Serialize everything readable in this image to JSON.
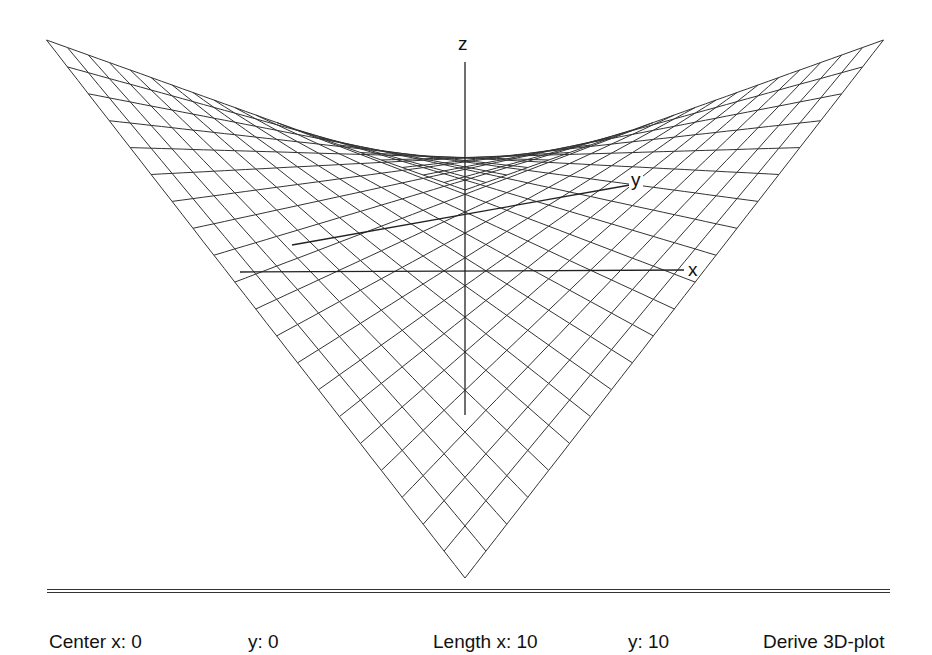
{
  "window": {
    "title": "3D-plot"
  },
  "plot": {
    "axis_labels": {
      "x": "x",
      "y": "y",
      "z": "z"
    },
    "grid_lines": 21,
    "line_color": "#333333",
    "axis_color": "#222222"
  },
  "status_bar": {
    "center_x_label": "Center x: 0",
    "center_y_label": "y: 0",
    "length_x_label": "Length x: 10",
    "length_y_label": "y: 10",
    "action_label": "Derive 3D-plot"
  },
  "chart_data": {
    "type": "surface-wireframe",
    "title": "",
    "function": "saddle (hyperbolic paraboloid)",
    "center": {
      "x": 0,
      "y": 0
    },
    "length": {
      "x": 10,
      "y": 10
    },
    "axis_labels": [
      "x",
      "y",
      "z"
    ],
    "xlim": [
      -5,
      5
    ],
    "ylim": [
      -5,
      5
    ],
    "grid": true,
    "mesh_resolution": 21,
    "projection": {
      "center_px": [
        465,
        212
      ],
      "half_width_px": 418.5,
      "depth_px": 194,
      "height_px": 172
    }
  }
}
